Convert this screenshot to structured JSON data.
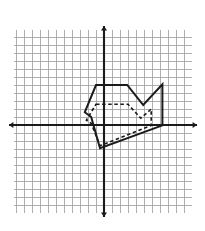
{
  "title": "Dilation",
  "chart_data": {
    "type": "scatter",
    "title": "Dilation",
    "subtitle": "",
    "xlabel": "",
    "ylabel": "",
    "grid": true,
    "legend_position": "none",
    "axis_style": "cartesian-double-arrow",
    "grid_spacing_units": 1,
    "xlim": [
      -11.25,
      11.0
    ],
    "ylim": [
      -11.0,
      11.875
    ],
    "x_tick_labels": [],
    "y_tick_labels": [],
    "annotations": [],
    "series": [
      {
        "name": "image-polygon-solid",
        "style": "solid",
        "color": "#1a1a1a",
        "closed": true,
        "linewidth": 2,
        "points": [
          [
            -1.0,
            5.0
          ],
          [
            2.9,
            5.0
          ],
          [
            4.9,
            2.5
          ],
          [
            7.3,
            5.1
          ],
          [
            7.3,
            -0.05
          ],
          [
            -0.5,
            -2.9
          ],
          [
            -1.6,
            1.0
          ],
          [
            -2.4,
            1.6
          ]
        ]
      },
      {
        "name": "preimage-polygon-dashed",
        "style": "dashed",
        "color": "#1a1a1a",
        "closed": true,
        "linewidth": 1.6,
        "dasharray": "3.5,2.6",
        "points": [
          [
            -1.0,
            2.6
          ],
          [
            3.0,
            2.6
          ],
          [
            4.6,
            0.85
          ],
          [
            5.9,
            2.0
          ],
          [
            5.9,
            -0.05
          ],
          [
            -0.5,
            -2.6
          ],
          [
            -1.6,
            0.2
          ],
          [
            -2.2,
            0.6
          ]
        ]
      }
    ],
    "axes": {
      "x_axis": {
        "name": "x-axis",
        "y_value": 0,
        "arrows": "both"
      },
      "y_axis": {
        "name": "y-axis",
        "x_value": 0,
        "arrows": "both"
      }
    },
    "grid_color": "#9a9a9e",
    "axis_color": "#1a1a1a",
    "background": "#ffffff"
  },
  "geometry": {
    "origin_px": [
      104,
      125
    ],
    "cell_px": 8,
    "grid_bounds_px": {
      "left": 14,
      "top": 30,
      "right": 192,
      "bottom": 213
    }
  }
}
